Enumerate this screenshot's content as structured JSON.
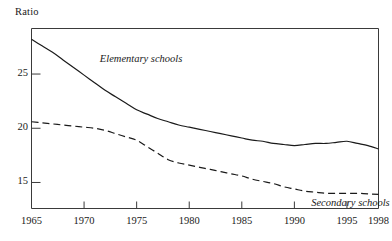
{
  "chart_data": {
    "type": "line",
    "title": "",
    "subtitle": "",
    "xlabel": "",
    "ylabel": "Ratio",
    "xlim": [
      1965,
      1998
    ],
    "ylim": [
      12.6,
      29.2
    ],
    "grid": false,
    "legend_position": "inline-annotations",
    "x_ticks": [
      "1965",
      "1970",
      "1975",
      "1980",
      "1985",
      "1990",
      "1995",
      "1998"
    ],
    "x_tick_values": [
      1965,
      1970,
      1975,
      1980,
      1985,
      1990,
      1995,
      1998
    ],
    "y_ticks": [
      "25",
      "20",
      "15"
    ],
    "y_tick_values": [
      25,
      20,
      15
    ],
    "x": [
      1965,
      1966,
      1967,
      1968,
      1969,
      1970,
      1971,
      1972,
      1973,
      1974,
      1975,
      1976,
      1977,
      1978,
      1979,
      1980,
      1981,
      1982,
      1983,
      1984,
      1985,
      1986,
      1987,
      1988,
      1989,
      1990,
      1991,
      1992,
      1993,
      1994,
      1995,
      1996,
      1997,
      1998
    ],
    "series": [
      {
        "name": "Elementary schools",
        "style": "solid",
        "color": "#1a1a1a",
        "label_x": 1971.5,
        "label_y": 26.3,
        "values": [
          28.2,
          27.6,
          27.0,
          26.3,
          25.6,
          24.9,
          24.2,
          23.5,
          22.9,
          22.3,
          21.7,
          21.3,
          20.9,
          20.6,
          20.3,
          20.1,
          19.9,
          19.7,
          19.5,
          19.3,
          19.1,
          18.9,
          18.8,
          18.6,
          18.5,
          18.4,
          18.5,
          18.6,
          18.6,
          18.7,
          18.8,
          18.6,
          18.4,
          18.1
        ]
      },
      {
        "name": "Secondary schools",
        "style": "dashed",
        "color": "#1a1a1a",
        "label_x": 1991.6,
        "label_y": 13.0,
        "values": [
          20.6,
          20.5,
          20.4,
          20.3,
          20.2,
          20.1,
          20.0,
          19.8,
          19.5,
          19.2,
          18.9,
          18.3,
          17.7,
          17.1,
          16.8,
          16.6,
          16.4,
          16.2,
          16.0,
          15.8,
          15.6,
          15.3,
          15.1,
          14.9,
          14.6,
          14.4,
          14.2,
          14.1,
          14.0,
          14.0,
          14.0,
          14.0,
          13.95,
          13.9
        ]
      }
    ]
  }
}
